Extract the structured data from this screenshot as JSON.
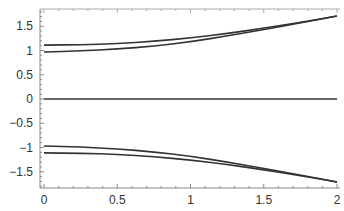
{
  "chart_data": {
    "type": "line",
    "title": "",
    "xlabel": "",
    "ylabel": "",
    "xlim": [
      0,
      2
    ],
    "ylim": [
      -1.85,
      1.85
    ],
    "grid": false,
    "legend": null,
    "x_ticks": [
      0,
      0.5,
      1,
      1.5,
      2
    ],
    "x_tick_labels": [
      "0",
      "0.5",
      "1",
      "1.5",
      "2"
    ],
    "y_ticks": [
      1.5,
      1,
      0.5,
      0,
      -0.5,
      -1,
      -1.5
    ],
    "y_tick_labels": [
      "1.5",
      "1",
      "0.5",
      "0",
      "-0.5",
      "-1",
      "-1.5"
    ],
    "x": [
      0,
      0.25,
      0.5,
      0.75,
      1,
      1.25,
      1.5,
      1.75,
      2
    ],
    "series": [
      {
        "name": "upper-outer",
        "values": [
          1.11,
          1.12,
          1.14,
          1.19,
          1.26,
          1.35,
          1.46,
          1.58,
          1.71
        ]
      },
      {
        "name": "upper-inner",
        "values": [
          0.97,
          0.99,
          1.03,
          1.09,
          1.18,
          1.3,
          1.43,
          1.57,
          1.71
        ]
      },
      {
        "name": "zero",
        "values": [
          0,
          0,
          0,
          0,
          0,
          0,
          0,
          0,
          0
        ]
      },
      {
        "name": "lower-inner",
        "values": [
          -0.97,
          -0.99,
          -1.03,
          -1.09,
          -1.18,
          -1.3,
          -1.43,
          -1.57,
          -1.71
        ]
      },
      {
        "name": "lower-outer",
        "values": [
          -1.11,
          -1.12,
          -1.14,
          -1.19,
          -1.26,
          -1.35,
          -1.46,
          -1.58,
          -1.71
        ]
      }
    ],
    "colors": {
      "line": "#333333",
      "axis": "#888888",
      "text": "#333333"
    }
  }
}
